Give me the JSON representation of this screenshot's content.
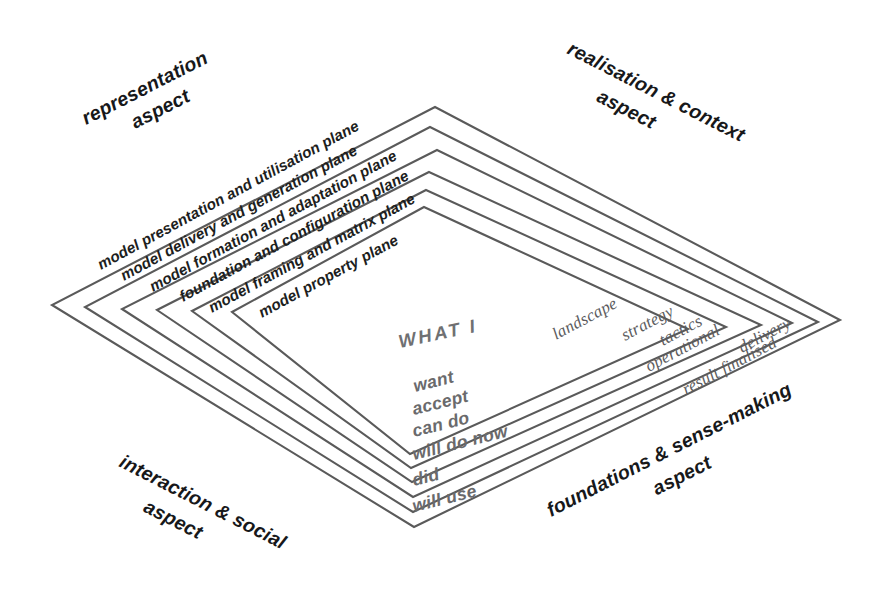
{
  "figure": {
    "background_color": "#ffffff",
    "line_color": "#5a5a5a",
    "aspect_text_color": "#17181a",
    "plane_text_color": "#1d1e20",
    "verb_text_color": "#6a6a6c",
    "stage_text_color": "#5c5c5e"
  },
  "aspects": {
    "top_left": {
      "line1": "representation",
      "line2": "aspect"
    },
    "top_right": {
      "line1": "realisation & context",
      "line2": "aspect"
    },
    "bottom_left": {
      "line1": "interaction & social",
      "line2": "aspect"
    },
    "bottom_right": {
      "line1": "foundations & sense-making",
      "line2": "aspect"
    }
  },
  "planes": [
    {
      "label": "model presentation and utilisation plane"
    },
    {
      "label": "model delivery and generation plane"
    },
    {
      "label": "model formation and adaptation plane"
    },
    {
      "label": "foundation and configuration plane"
    },
    {
      "label": "model framing and matrix plane"
    },
    {
      "label": "model property plane"
    }
  ],
  "center": {
    "prefix": "WHAT I"
  },
  "verbs": [
    {
      "label": "want"
    },
    {
      "label": "accept"
    },
    {
      "label": "can do"
    },
    {
      "label": "will do now"
    },
    {
      "label": "did"
    },
    {
      "label": "will use"
    }
  ],
  "stages": [
    {
      "label": "landscape"
    },
    {
      "label": "strategy"
    },
    {
      "label": "tactics"
    },
    {
      "label": "operational"
    },
    {
      "label": "delivery"
    },
    {
      "label": "result finalised"
    }
  ]
}
